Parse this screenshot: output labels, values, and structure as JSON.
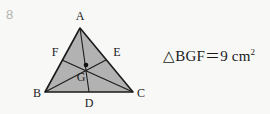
{
  "problem": {
    "number": "8"
  },
  "figure": {
    "name": "triangle-with-medians",
    "fill_color": "#b2b2b2",
    "stroke_color": "#1a1a1a",
    "background_color": "#f8f8f6",
    "vertices": [
      {
        "label": "A",
        "x": 80,
        "y": 28,
        "label_x": 80,
        "label_y": 20
      },
      {
        "label": "B",
        "x": 45,
        "y": 92,
        "label_x": 37,
        "label_y": 97
      },
      {
        "label": "C",
        "x": 133,
        "y": 92,
        "label_x": 141,
        "label_y": 97
      }
    ],
    "midpoints": [
      {
        "label": "D",
        "x": 89,
        "y": 92,
        "label_x": 89,
        "label_y": 106
      },
      {
        "label": "E",
        "x": 106,
        "y": 60,
        "label_x": 117,
        "label_y": 55
      },
      {
        "label": "F",
        "x": 62,
        "y": 60,
        "label_x": 55,
        "label_y": 55
      }
    ],
    "centroid": {
      "label": "G",
      "x": 86,
      "y": 65,
      "label_x": 81,
      "label_y": 80
    },
    "medians": [
      {
        "name": "median-AD",
        "from": "A",
        "to": "D"
      },
      {
        "name": "median-BE",
        "from": "B",
        "to": "E"
      },
      {
        "name": "median-CF",
        "from": "C",
        "to": "F"
      }
    ]
  },
  "statement": {
    "triangle_symbol": "△",
    "triangle_name": "BGF",
    "equals": "＝",
    "value": "9",
    "unit": "cm",
    "unit_exponent": "2",
    "full_text": "△BGF＝9 cm²"
  }
}
